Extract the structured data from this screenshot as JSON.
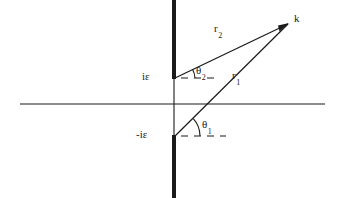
{
  "figure": {
    "kind": "complex-plane-branch-cut-diagram",
    "width": 342,
    "height": 198,
    "background_color": "#ffffff",
    "ink_color": "#1a1a1a"
  },
  "labels": {
    "upper_branch_point": "iε",
    "lower_branch_point": "-iε",
    "field_point": "k",
    "radius_upper_base": "r",
    "radius_upper_sub": "2",
    "radius_lower_base": "r",
    "radius_lower_sub": "1",
    "angle_upper_base": "θ",
    "angle_upper_sub": "2",
    "angle_lower_base": "θ",
    "angle_lower_sub": "1"
  },
  "geometry": {
    "branch_cut_x": 174,
    "real_axis_y": 104,
    "real_axis_x_start": 20,
    "real_axis_x_end": 325,
    "upper_branch_point_xy": [
      174,
      78
    ],
    "lower_branch_point_xy": [
      174,
      136
    ],
    "field_point_xy": [
      288,
      24
    ],
    "branch_cut_thickness": 4,
    "thin_line_thickness": 1.1,
    "upper_cut_span_y": [
      0,
      78
    ],
    "lower_cut_span_y": [
      136,
      198
    ],
    "dashed_ref_upper": {
      "y": 78,
      "x_start": 180,
      "x_end": 216
    },
    "dashed_ref_lower": {
      "y": 136,
      "x_start": 180,
      "x_end": 226
    },
    "angle_upper_degrees": 28,
    "angle_lower_degrees": 42
  }
}
